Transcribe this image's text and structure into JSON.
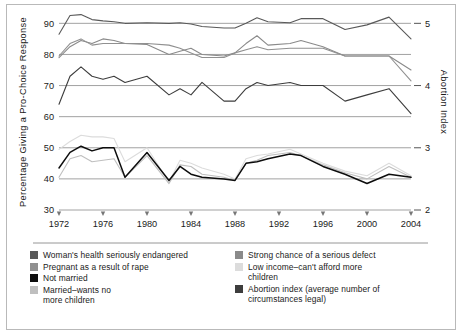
{
  "figure": {
    "background_color": "#ffffff",
    "border_color": "#b9b9b9"
  },
  "axes": {
    "y_left_title": "Percentage  Giving a Pro-Choice Response",
    "y_right_title": "Abortion Index",
    "y_left_ticks": [
      "30",
      "40",
      "50",
      "60",
      "70",
      "80",
      "90"
    ],
    "y_right_ticks": [
      "2",
      "3",
      "4",
      "5"
    ],
    "x_ticks": [
      "1972",
      "1976",
      "1980",
      "1984",
      "1988",
      "1992",
      "1996",
      "2000",
      "2004"
    ]
  },
  "legend": {
    "left_items": [
      {
        "label": "Woman's health seriously endangered",
        "color": "#595959"
      },
      {
        "label": "Pregnant as a result of rape",
        "color": "#909090"
      },
      {
        "label": "Not married",
        "color": "#0d0d0d"
      },
      {
        "label": "Married–wants no\nmore children",
        "color": "#bfbfbf"
      }
    ],
    "right_items": [
      {
        "label": "Strong chance of a serious defect",
        "color": "#8a8a8a"
      },
      {
        "label": "Low income–can't afford more\nchildren",
        "color": "#dcdcdc"
      },
      {
        "label": "Abortion index (average number of\ncircumstances legal)",
        "color": "#3d3d3d"
      }
    ]
  },
  "chart_data": {
    "type": "line",
    "title": "",
    "xlabel": "",
    "ylabel": "Percentage  Giving a Pro-Choice Response",
    "y2label": "Abortion Index",
    "xlim": [
      1972,
      2004
    ],
    "ylim": [
      30,
      93
    ],
    "y2lim": [
      2,
      5.2
    ],
    "yticks": [
      30,
      40,
      50,
      60,
      70,
      80,
      90
    ],
    "y2ticks": [
      2,
      3,
      4,
      5
    ],
    "xticks": [
      1972,
      1976,
      1980,
      1984,
      1988,
      1992,
      1996,
      2000,
      2004
    ],
    "grid": true,
    "legend_position": "below-plot",
    "x": [
      1972,
      1973,
      1974,
      1975,
      1976,
      1977,
      1978,
      1980,
      1982,
      1983,
      1984,
      1985,
      1987,
      1988,
      1989,
      1990,
      1991,
      1993,
      1994,
      1996,
      1998,
      2000,
      2002,
      2004
    ],
    "series": [
      {
        "name": "Woman's health seriously endangered",
        "color": "#595959",
        "axis": "left",
        "values": [
          86.5,
          92.5,
          92.8,
          91.2,
          90.8,
          90.5,
          90.0,
          90.2,
          90.0,
          90.2,
          89.8,
          89.0,
          88.5,
          88.5,
          90.0,
          91.8,
          90.5,
          90.2,
          91.5,
          91.5,
          88.0,
          89.5,
          92.0,
          85.0
        ]
      },
      {
        "name": "Strong chance of a serious defect",
        "color": "#8a8a8a",
        "axis": "left",
        "values": [
          79.0,
          82.5,
          84.5,
          83.5,
          85.0,
          84.5,
          83.5,
          83.2,
          80.0,
          81.0,
          82.0,
          80.0,
          79.5,
          80.5,
          83.5,
          86.0,
          83.0,
          83.5,
          84.5,
          82.5,
          79.5,
          79.5,
          79.5,
          75.0
        ]
      },
      {
        "name": "Pregnant as a result of rape",
        "color": "#909090",
        "axis": "left",
        "values": [
          79.5,
          83.5,
          85.0,
          83.0,
          83.5,
          83.5,
          83.5,
          83.5,
          83.0,
          82.0,
          80.5,
          79.0,
          79.0,
          80.5,
          81.5,
          82.5,
          81.5,
          82.0,
          82.0,
          82.0,
          79.5,
          79.5,
          79.5,
          71.5
        ]
      },
      {
        "name": "Abortion index (average number of circumstances legal)",
        "color": "#3d3d3d",
        "axis": "right",
        "values": [
          3.7,
          4.15,
          4.3,
          4.15,
          4.1,
          4.15,
          4.05,
          4.15,
          3.85,
          3.95,
          3.85,
          4.05,
          3.75,
          3.75,
          3.95,
          4.05,
          4.0,
          4.05,
          4.0,
          4.0,
          3.75,
          3.85,
          3.95,
          3.55
        ]
      },
      {
        "name": "Low income–can't afford more children",
        "color": "#dcdcdc",
        "axis": "left",
        "values": [
          49.5,
          52.0,
          54.0,
          53.5,
          53.5,
          53.0,
          45.5,
          50.0,
          39.0,
          46.0,
          45.0,
          43.5,
          41.5,
          40.0,
          46.5,
          47.5,
          48.0,
          49.5,
          48.0,
          45.0,
          42.5,
          41.0,
          45.0,
          41.0
        ]
      },
      {
        "name": "Married–wants no more children",
        "color": "#bfbfbf",
        "axis": "left",
        "values": [
          40.5,
          46.5,
          47.5,
          45.5,
          46.0,
          46.5,
          40.5,
          47.5,
          38.5,
          44.5,
          44.0,
          41.5,
          40.5,
          39.5,
          45.0,
          46.0,
          47.5,
          48.5,
          47.5,
          44.5,
          42.0,
          40.0,
          44.0,
          40.5
        ]
      },
      {
        "name": "Not married",
        "color": "#0d0d0d",
        "axis": "left",
        "values": [
          43.5,
          48.5,
          50.5,
          49.0,
          50.0,
          50.0,
          40.5,
          48.5,
          39.5,
          44.0,
          41.5,
          40.5,
          40.0,
          39.5,
          45.0,
          45.5,
          46.5,
          48.0,
          47.5,
          44.0,
          41.5,
          38.5,
          41.5,
          40.5
        ]
      }
    ]
  }
}
